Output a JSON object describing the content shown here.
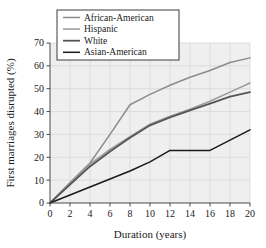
{
  "chart_data": {
    "type": "line",
    "title": "",
    "xlabel": "Duration (years)",
    "ylabel": "First marriages disrupted (%)",
    "xlim": [
      0,
      20
    ],
    "ylim": [
      0,
      70
    ],
    "xticks": [
      0,
      2,
      4,
      6,
      8,
      10,
      12,
      14,
      16,
      18,
      20
    ],
    "yticks": [
      0,
      10,
      20,
      30,
      40,
      50,
      60,
      70
    ],
    "xtick_labels": [
      "0",
      "2",
      "4",
      "6",
      "8",
      "10",
      "12",
      "14",
      "16",
      "18",
      "20"
    ],
    "ytick_labels": [
      "0",
      "10",
      "20",
      "30",
      "40",
      "50",
      "60",
      "70"
    ],
    "grid": true,
    "legend_position": "top-left",
    "x": [
      0,
      2,
      4,
      6,
      8,
      10,
      12,
      14,
      16,
      18,
      20
    ],
    "series": [
      {
        "name": "African-American",
        "color": "#8c8c8c",
        "width": 1.5,
        "values": [
          0,
          9,
          17.5,
          30,
          43,
          47.5,
          51.5,
          55,
          58,
          61.5,
          63.5
        ]
      },
      {
        "name": "Hispanic",
        "color": "#9a9a9a",
        "width": 1.5,
        "values": [
          0,
          8.5,
          17,
          23.5,
          29,
          34.5,
          38,
          41,
          44.5,
          48.5,
          52.5
        ]
      },
      {
        "name": "White",
        "color": "#555555",
        "width": 1.8,
        "values": [
          0,
          8,
          16,
          22.5,
          28.5,
          34,
          37.5,
          40.5,
          43.5,
          46.5,
          48.5
        ]
      },
      {
        "name": "Asian-American",
        "color": "#1a1a1a",
        "width": 1.5,
        "values": [
          0,
          3.5,
          7,
          10.5,
          14,
          18,
          23,
          23,
          23,
          27.5,
          32
        ]
      }
    ]
  },
  "legend": {
    "entries": [
      {
        "label": "African-American"
      },
      {
        "label": "Hispanic"
      },
      {
        "label": "White"
      },
      {
        "label": "Asian-American"
      }
    ]
  },
  "axes": {
    "x_title": "Duration (years)",
    "y_title": "First marriages disrupted (%)"
  }
}
